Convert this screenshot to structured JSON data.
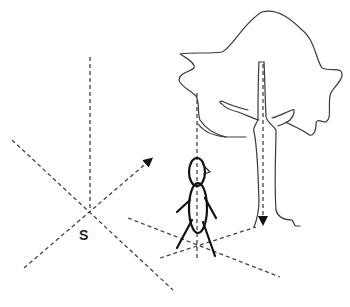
{
  "diagram": {
    "labels": {
      "origin": "S"
    },
    "colors": {
      "background": "#ffffff",
      "line": "#444444",
      "figure": "#111111"
    },
    "elements": [
      {
        "id": "vertical-axis",
        "type": "dashed-line"
      },
      {
        "id": "diagonal-axis-1",
        "type": "dashed-line"
      },
      {
        "id": "diagonal-axis-2",
        "type": "dashed-arrow"
      },
      {
        "id": "tree",
        "type": "outline"
      },
      {
        "id": "tree-trunk-axis",
        "type": "dashed-arrow"
      },
      {
        "id": "stick-figure",
        "type": "figure"
      },
      {
        "id": "figure-vertical-axis",
        "type": "dashed-line"
      },
      {
        "id": "ground-lines",
        "type": "dashed-lines"
      }
    ]
  }
}
